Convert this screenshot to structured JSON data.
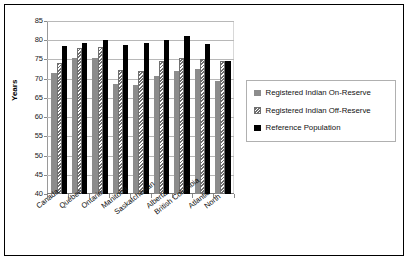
{
  "chart_data": {
    "type": "bar",
    "title": "",
    "xlabel": "",
    "ylabel": "Years",
    "ylim": [
      40,
      85
    ],
    "yticks": [
      40,
      45,
      50,
      55,
      60,
      65,
      70,
      75,
      80,
      85
    ],
    "grid": true,
    "legend_position": "right",
    "categories": [
      "Canada",
      "Québec",
      "Ontario",
      "Manitoba",
      "Saskatchewan",
      "Alberta",
      "British Columbia",
      "Atlantic",
      "North"
    ],
    "series": [
      {
        "name": "Registered Indian On-Reserve",
        "color": "#8c8c8c",
        "pattern": "solid",
        "values": [
          71.5,
          75.5,
          75.5,
          68.5,
          68.3,
          70.8,
          72.0,
          72.5,
          69.5
        ]
      },
      {
        "name": "Registered Indian Off-Reserve",
        "color": "#6f6f6f",
        "pattern": "diagonal-hatch",
        "values": [
          74.2,
          78.0,
          78.2,
          72.3,
          72.0,
          74.5,
          75.5,
          75.0,
          74.5
        ]
      },
      {
        "name": "Reference Population",
        "color": "#000000",
        "pattern": "solid",
        "values": [
          78.6,
          79.4,
          80.0,
          78.8,
          79.3,
          80.0,
          81.0,
          79.0,
          74.5
        ]
      }
    ]
  },
  "legend": {
    "items": [
      {
        "label": "Registered Indian On-Reserve"
      },
      {
        "label": "Registered Indian Off-Reserve"
      },
      {
        "label": "Reference Population"
      }
    ]
  }
}
